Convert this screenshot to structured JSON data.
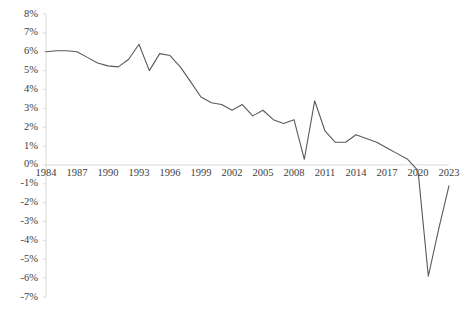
{
  "chart_data": {
    "type": "line",
    "title": "",
    "xlabel": "",
    "ylabel": "",
    "grid": false,
    "legend": "none",
    "line_color": "#595959",
    "axis_color": "#d9d9d9",
    "tick_text_color": "#404040",
    "xlim": [
      1984,
      2023
    ],
    "ylim": [
      -7,
      8
    ],
    "ytick_step": 1,
    "ytick_labels": [
      "8%",
      "7%",
      "6%",
      "5%",
      "4%",
      "3%",
      "2%",
      "1%",
      "0%",
      "-1%",
      "-2%",
      "-3%",
      "-4%",
      "-5%",
      "-6%",
      "-7%"
    ],
    "ytick_values": [
      8,
      7,
      6,
      5,
      4,
      3,
      2,
      1,
      0,
      -1,
      -2,
      -3,
      -4,
      -5,
      -6,
      -7
    ],
    "xtick_labels": [
      "1984",
      "1987",
      "1990",
      "1993",
      "1996",
      "1999",
      "2002",
      "2005",
      "2008",
      "2011",
      "2014",
      "2017",
      "2020",
      "2023"
    ],
    "xtick_values": [
      1984,
      1987,
      1990,
      1993,
      1996,
      1999,
      2002,
      2005,
      2008,
      2011,
      2014,
      2017,
      2020,
      2023
    ],
    "x": [
      1984,
      1985,
      1986,
      1987,
      1988,
      1989,
      1990,
      1991,
      1992,
      1993,
      1994,
      1995,
      1996,
      1997,
      1998,
      1999,
      2000,
      2001,
      2002,
      2003,
      2004,
      2005,
      2006,
      2007,
      2008,
      2009,
      2010,
      2011,
      2012,
      2013,
      2014,
      2015,
      2016,
      2017,
      2018,
      2019,
      2020,
      2021,
      2022,
      2023
    ],
    "values": [
      6.0,
      6.05,
      6.05,
      6.0,
      5.7,
      5.4,
      5.25,
      5.2,
      5.6,
      6.4,
      5.0,
      5.9,
      5.8,
      5.2,
      4.4,
      3.6,
      3.3,
      3.2,
      2.9,
      3.2,
      2.6,
      2.9,
      2.4,
      2.2,
      2.4,
      0.3,
      3.4,
      1.8,
      1.2,
      1.2,
      1.6,
      1.4,
      1.2,
      0.9,
      0.6,
      0.3,
      -0.3,
      -5.9,
      -3.4,
      -1.1
    ],
    "series_name": "value"
  }
}
